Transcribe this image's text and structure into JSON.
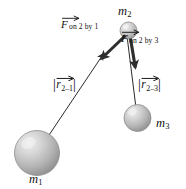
{
  "figure": {
    "width": 186,
    "height": 189,
    "background_color": "#ffffff",
    "ink_color": "#1a1a1a"
  },
  "masses": [
    {
      "id": "m1",
      "label_base": "m",
      "label_sub": "1",
      "cx": 37,
      "cy": 153,
      "r": 22.5,
      "label_x": 29,
      "label_y": 174,
      "fill_light": "#e2e2e2",
      "fill_mid": "#b9b9b9",
      "fill_dark": "#8d8d8d",
      "stroke": "#8a8a8a"
    },
    {
      "id": "m2",
      "label_base": "m",
      "label_sub": "2",
      "cx": 128.5,
      "cy": 30.5,
      "r": 8.5,
      "label_x": 118,
      "label_y": 7,
      "fill_light": "#e4e4e4",
      "fill_mid": "#bdbdbd",
      "fill_dark": "#929292",
      "stroke": "#8a8a8a"
    },
    {
      "id": "m3",
      "label_base": "m",
      "label_sub": "3",
      "cx": 137.5,
      "cy": 118,
      "r": 13.5,
      "label_x": 156,
      "label_y": 120,
      "fill_light": "#e2e2e2",
      "fill_mid": "#b9b9b9",
      "fill_dark": "#8d8d8d",
      "stroke": "#8a8a8a"
    }
  ],
  "distance_vectors": [
    {
      "id": "r-2-1",
      "label_base": "r",
      "label_sub": "2–1",
      "from": "m1",
      "to": "m2",
      "x1": 37,
      "y1": 153,
      "x2": 104,
      "y2": 53,
      "label_x": 54,
      "label_y": 84,
      "stroke": "#2b2b2b",
      "stroke_width": 1.0
    },
    {
      "id": "r-2-3",
      "label_base": "r",
      "label_sub": "2–3",
      "from": "m2",
      "to": "m3",
      "x1": 127,
      "y1": 36,
      "x2": 137,
      "y2": 118,
      "label_x": 139,
      "label_y": 84,
      "stroke": "#2b2b2b",
      "stroke_width": 1.0
    }
  ],
  "force_vectors": [
    {
      "id": "force-on-2-by-1",
      "symbol": "F",
      "subscript": "on 2 by 1",
      "x1": 125,
      "y1": 36,
      "x2": 99,
      "y2": 61,
      "label_x": 66,
      "label_y": 25,
      "stroke": "#2e2e2e",
      "stroke_width": 3.2
    },
    {
      "id": "force-on-2-by-3",
      "symbol": "F",
      "subscript": "on 2 by 3",
      "x1": 131,
      "y1": 39,
      "x2": 136,
      "y2": 70,
      "label_x": 125,
      "label_y": 39,
      "stroke": "#2e2e2e",
      "stroke_width": 3.2
    }
  ]
}
